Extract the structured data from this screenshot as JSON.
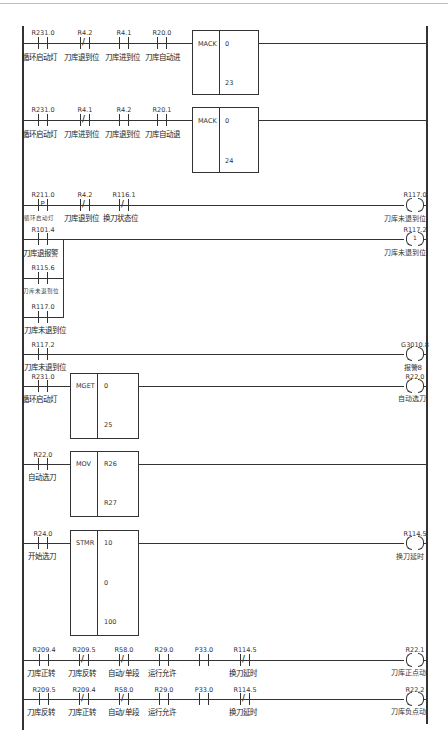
{
  "diagram": {
    "type": "ladder-logic",
    "rungs": [
      {
        "id": 1,
        "contacts": [
          {
            "addr": "R231.0",
            "type": "NO",
            "label": "循环启动灯"
          },
          {
            "addr": "R4.2",
            "type": "NC",
            "label": "刀库退到位"
          },
          {
            "addr": "R4.1",
            "type": "NO",
            "label": "刀库进到位"
          },
          {
            "addr": "R20.0",
            "type": "NO",
            "label": "刀库自动进"
          }
        ],
        "function": {
          "name": "MACK",
          "params": [
            "0",
            "23"
          ]
        }
      },
      {
        "id": 2,
        "contacts": [
          {
            "addr": "R231.0",
            "type": "NO",
            "label": "循环启动灯"
          },
          {
            "addr": "R4.1",
            "type": "NC",
            "label": "刀库进到位"
          },
          {
            "addr": "R4.2",
            "type": "NO",
            "label": "刀库退到位"
          },
          {
            "addr": "R20.1",
            "type": "NO",
            "label": "刀库自动退"
          }
        ],
        "function": {
          "name": "MACK",
          "params": [
            "0",
            "24"
          ]
        }
      },
      {
        "id": 3,
        "contacts": [
          {
            "addr": "R211.0",
            "type": "P",
            "label": "循环启动灯",
            "mark": "P"
          },
          {
            "addr": "R4.2",
            "type": "NC",
            "label": "刀库退到位"
          },
          {
            "addr": "R116.1",
            "type": "NC",
            "label": "换刀状态位"
          }
        ],
        "coil": {
          "addr": "R117.0",
          "type": "normal",
          "label": "刀库未退到位"
        }
      },
      {
        "id": 4,
        "contacts": [
          {
            "addr": "R101.4",
            "type": "NO",
            "label": "刀库退报警"
          },
          {
            "addr": "R115.6",
            "type": "NO",
            "label": "刀库未退到位"
          },
          {
            "addr": "R117.0",
            "type": "NO",
            "label": "刀库未退到位"
          }
        ],
        "coil": {
          "addr": "R117.2",
          "type": "set",
          "mark": "1",
          "label": "刀库未退到位"
        }
      },
      {
        "id": 5,
        "contacts": [
          {
            "addr": "R117.2",
            "type": "NO",
            "label": "刀库未退到位"
          }
        ],
        "coil": {
          "addr": "G3010.8",
          "type": "normal",
          "label": "报警8"
        }
      },
      {
        "id": 6,
        "contacts": [
          {
            "addr": "R231.0",
            "type": "NO",
            "label": "循环启动灯"
          }
        ],
        "function": {
          "name": "MGET",
          "params": [
            "0",
            "25"
          ]
        },
        "coil": {
          "addr": "R22.0",
          "type": "normal",
          "label": "自动选刀"
        }
      },
      {
        "id": 7,
        "contacts": [
          {
            "addr": "R22.0",
            "type": "NO",
            "label": "自动选刀"
          }
        ],
        "function": {
          "name": "MOV",
          "params": [
            "R26",
            "R27"
          ]
        }
      },
      {
        "id": 8,
        "contacts": [
          {
            "addr": "R24.0",
            "type": "NO",
            "label": "开始选刀"
          }
        ],
        "function": {
          "name": "STMR",
          "params": [
            "10",
            "0",
            "100"
          ]
        },
        "coil": {
          "addr": "R114.5",
          "type": "normal",
          "label": "换刀延时"
        }
      },
      {
        "id": 9,
        "contacts": [
          {
            "addr": "R209.4",
            "type": "NO",
            "label": "刀库正转"
          },
          {
            "addr": "R209.5",
            "type": "NC",
            "label": "刀库反转"
          },
          {
            "addr": "R58.0",
            "type": "NC",
            "label": "自动/单段"
          },
          {
            "addr": "R29.0",
            "type": "NO",
            "label": "运行允许"
          },
          {
            "addr": "P33.0",
            "type": "NO",
            "label": ""
          },
          {
            "addr": "R114.5",
            "type": "NC",
            "label": "换刀延时"
          }
        ],
        "coil": {
          "addr": "R22.1",
          "type": "normal",
          "label": "刀库正点动"
        }
      },
      {
        "id": 10,
        "contacts": [
          {
            "addr": "R209.5",
            "type": "NO",
            "label": "刀库反转"
          },
          {
            "addr": "R209.4",
            "type": "NC",
            "label": "刀库正转"
          },
          {
            "addr": "R58.0",
            "type": "NC",
            "label": "自动/单段"
          },
          {
            "addr": "R29.0",
            "type": "NO",
            "label": "运行允许"
          },
          {
            "addr": "P33.0",
            "type": "NO",
            "label": ""
          },
          {
            "addr": "R114.5",
            "type": "NC",
            "label": "换刀延时"
          }
        ],
        "coil": {
          "addr": "R22.2",
          "type": "normal",
          "label": "刀库负点动"
        }
      }
    ]
  },
  "colors": {
    "line": "#333333",
    "background": "#ffffff",
    "border": "#bdbdbd"
  }
}
